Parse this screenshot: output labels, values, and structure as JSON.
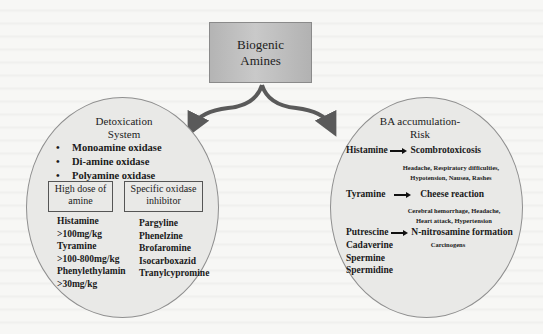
{
  "root": {
    "title_line1": "Biogenic",
    "title_line2": "Amines",
    "fill_color": "#bdbdbd"
  },
  "left_panel": {
    "heading_line1": "Detoxication",
    "heading_line2": "System",
    "enzymes": [
      {
        "bullet": "•",
        "label": "Monoamine oxidase"
      },
      {
        "bullet": "•",
        "label": "Di-amine oxidase"
      },
      {
        "bullet": "•",
        "label": "Polyamine oxidase"
      }
    ],
    "high_dose_box": {
      "line1": "High dose of",
      "line2": "amine"
    },
    "inhibitor_box": {
      "line1": "Specific oxidase",
      "line2": "inhibitor"
    },
    "high_dose_items": [
      "Histamine",
      ">100mg/kg",
      "Tyramine",
      ">100-800mg/kg",
      "Phenylethylamin",
      ">30mg/kg"
    ],
    "inhibitors": [
      "Pargyline",
      "Phenelzine",
      "Brofaromine",
      "Isocarboxazid",
      "Tranylcypromine"
    ]
  },
  "right_panel": {
    "heading_line1": "BA accumulation-",
    "heading_line2": "Risk",
    "risks": [
      {
        "amine": "Histamine",
        "outcome": "Scombrotoxicosis",
        "effects_line1": "Headache, Respiratory difficulties,",
        "effects_line2": "Hypotension, Nausea, Rashes"
      },
      {
        "amine": "Tyramine",
        "outcome": "Cheese reaction",
        "effects_line1": "Cerebral hemorrhage, Headache,",
        "effects_line2": "Heart attack, Hypertension"
      },
      {
        "amine": "Putrescine",
        "outcome": "N-nitrosamine formation",
        "effects_line1": "Carcinogens"
      }
    ],
    "other_amines": [
      "Cadaverine",
      "Spermine",
      "Spermidine"
    ]
  },
  "colors": {
    "arrow": "#5a5a5a",
    "circle_fill": "#e9e9e7",
    "circle_stroke": "#8f8f8f",
    "background": "#f7f7f5"
  }
}
